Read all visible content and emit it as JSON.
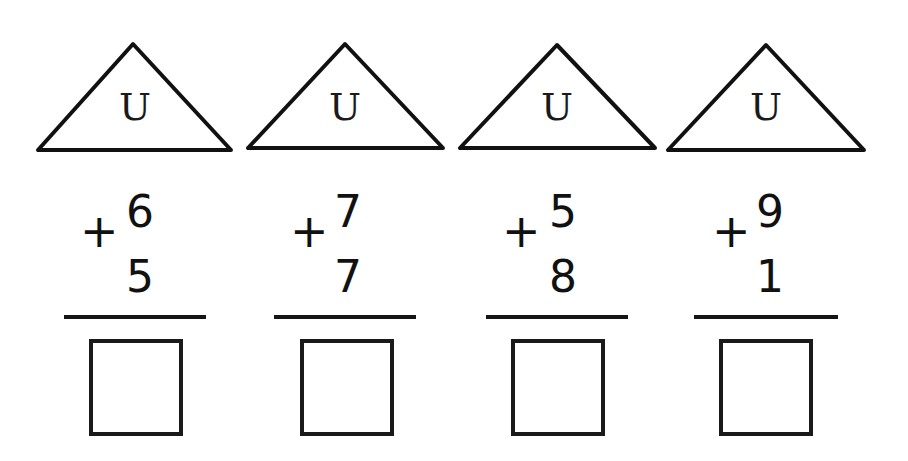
{
  "worksheet": {
    "roof_symbol": "U",
    "operator": "+",
    "problems": [
      {
        "top_number": "6",
        "bottom_number": "5",
        "answer": ""
      },
      {
        "top_number": "7",
        "bottom_number": "7",
        "answer": ""
      },
      {
        "top_number": "5",
        "bottom_number": "8",
        "answer": ""
      },
      {
        "top_number": "9",
        "bottom_number": "1",
        "answer": ""
      }
    ]
  },
  "colors": {
    "ink": "#111111",
    "background": "#ffffff"
  }
}
